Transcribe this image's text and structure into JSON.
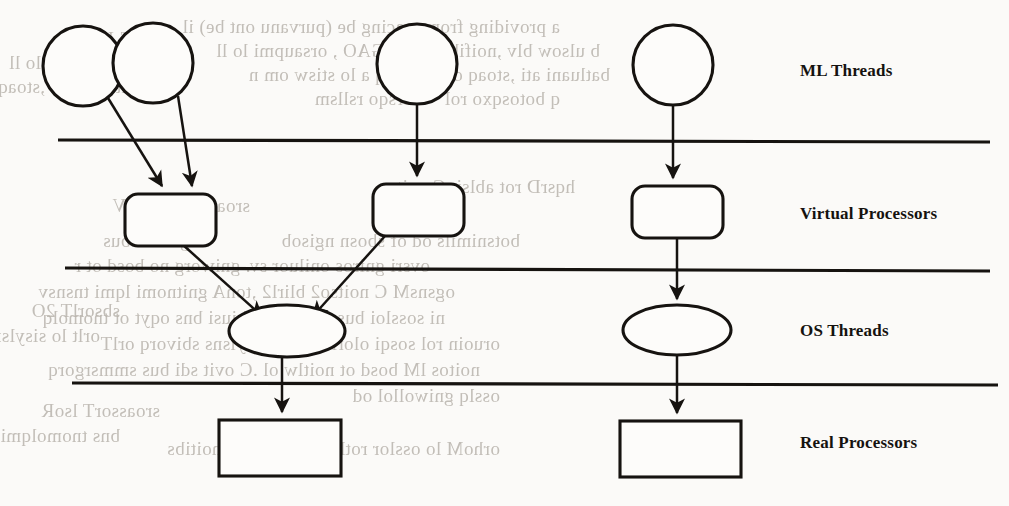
{
  "figure": {
    "layers": [
      {
        "id": "ml-threads",
        "label": "ML Threads",
        "label_x": 800,
        "label_y": 61,
        "shape": "circle"
      },
      {
        "id": "virtual-processors",
        "label": "Virtual Processors",
        "label_x": 800,
        "label_y": 204,
        "shape": "rounded-rect"
      },
      {
        "id": "os-threads",
        "label": "OS Threads",
        "label_x": 800,
        "label_y": 321,
        "shape": "ellipse"
      },
      {
        "id": "real-processors",
        "label": "Real Processors",
        "label_x": 800,
        "label_y": 433,
        "shape": "rect"
      }
    ],
    "dividers": [
      {
        "id": "divider-ml-vp",
        "x1": 58,
        "y1": 140,
        "x2": 990,
        "y2": 142
      },
      {
        "id": "divider-vp-os",
        "x1": 65,
        "y1": 268,
        "x2": 990,
        "y2": 271
      },
      {
        "id": "divider-os-rp",
        "x1": 72,
        "y1": 383,
        "x2": 998,
        "y2": 385
      }
    ],
    "nodes": {
      "ml_threads": [
        {
          "id": "ml-thread-1",
          "cx": 83,
          "cy": 66,
          "r": 40
        },
        {
          "id": "ml-thread-2",
          "cx": 153,
          "cy": 63,
          "r": 40
        },
        {
          "id": "ml-thread-3",
          "cx": 417,
          "cy": 64,
          "r": 40
        },
        {
          "id": "ml-thread-4",
          "cx": 673,
          "cy": 65,
          "r": 40
        }
      ],
      "virtual_processors": [
        {
          "id": "virtual-processor-1",
          "x": 125,
          "y": 194,
          "w": 91,
          "h": 52,
          "r": 13
        },
        {
          "id": "virtual-processor-2",
          "x": 373,
          "y": 184,
          "w": 91,
          "h": 52,
          "r": 13
        },
        {
          "id": "virtual-processor-3",
          "x": 632,
          "y": 186,
          "w": 91,
          "h": 52,
          "r": 13
        }
      ],
      "os_threads": [
        {
          "id": "os-thread-1",
          "cx": 287,
          "cy": 331,
          "rx": 58,
          "ry": 26
        },
        {
          "id": "os-thread-2",
          "cx": 677,
          "cy": 330,
          "rx": 54,
          "ry": 25
        }
      ],
      "real_processors": [
        {
          "id": "real-processor-1",
          "x": 219,
          "y": 420,
          "w": 122,
          "h": 56
        },
        {
          "id": "real-processor-2",
          "x": 620,
          "y": 421,
          "w": 121,
          "h": 56
        }
      ]
    },
    "edges": [
      {
        "id": "edge-ml1-vp1",
        "from": "ml-thread-1",
        "to": "virtual-processor-1",
        "x1": 108,
        "y1": 98,
        "x2": 162,
        "y2": 186
      },
      {
        "id": "edge-ml2-vp1",
        "from": "ml-thread-2",
        "to": "virtual-processor-1",
        "x1": 178,
        "y1": 96,
        "x2": 192,
        "y2": 186
      },
      {
        "id": "edge-ml3-vp2",
        "from": "ml-thread-3",
        "to": "virtual-processor-2",
        "x1": 417,
        "y1": 104,
        "x2": 417,
        "y2": 176
      },
      {
        "id": "edge-ml4-vp3",
        "from": "ml-thread-4",
        "to": "virtual-processor-3",
        "x1": 673,
        "y1": 105,
        "x2": 673,
        "y2": 178
      },
      {
        "id": "edge-vp1-os1",
        "from": "virtual-processor-1",
        "to": "os-thread-1",
        "x1": 182,
        "y1": 244,
        "x2": 262,
        "y2": 316
      },
      {
        "id": "edge-vp2-os1",
        "from": "virtual-processor-2",
        "to": "os-thread-1",
        "x1": 385,
        "y1": 236,
        "x2": 313,
        "y2": 316
      },
      {
        "id": "edge-vp3-os2",
        "from": "virtual-processor-3",
        "to": "os-thread-2",
        "x1": 677,
        "y1": 238,
        "x2": 677,
        "y2": 299
      },
      {
        "id": "edge-os1-rp1",
        "from": "os-thread-1",
        "to": "real-processor-1",
        "x1": 282,
        "y1": 357,
        "x2": 282,
        "y2": 412
      },
      {
        "id": "edge-os2-rp2",
        "from": "os-thread-2",
        "to": "real-processor-2",
        "x1": 677,
        "y1": 355,
        "x2": 677,
        "y2": 413
      }
    ]
  },
  "background_text": {
    "description": "faint mirrored bleed-through text from the reverse side of the scanned page",
    "lines": [
      {
        "id": "ghost-1",
        "text": "a providing from cracing be (purvanu ont be) il",
        "x": 560,
        "y": 16,
        "size": 19
      },
      {
        "id": "ghost-2",
        "text": "b ulsow blv ,noifibno ban ,GAO , orsaupmi lo ll",
        "x": 600,
        "y": 40,
        "size": 19
      },
      {
        "id": "ghost-3",
        "text": "batluani ati ,stoaq od lo toorq a lo stisw om n",
        "x": 610,
        "y": 64,
        "size": 19
      },
      {
        "id": "ghost-4",
        "text": "q botosqxo rol \" otsrsqo rsllsm",
        "x": 560,
        "y": 88,
        "size": 19
      },
      {
        "id": "ghost-5",
        "text": "hqsrD rot ablsi .C noitso",
        "x": 575,
        "y": 176,
        "size": 19
      },
      {
        "id": "ghost-6",
        "text": "botsnimils od of sbosn ngisob",
        "x": 520,
        "y": 230,
        "size": 19
      },
      {
        "id": "ghost-7",
        "text": "ovsri gniros oniluor sv. gniworg no bosd ot r",
        "x": 430,
        "y": 255,
        "size": 19
      },
      {
        "id": "ghost-8",
        "text": "ogsnsM C noitso2 blirl2 ,tonA gnitnomi lqmi tnsnsv",
        "x": 455,
        "y": 281,
        "size": 19
      },
      {
        "id": "ghost-9",
        "text": "ni sossloi bus xovi osrq .biusi bns oqyt ot tnomolq",
        "x": 445,
        "y": 307,
        "size": 19
      },
      {
        "id": "ghost-10",
        "text": "oruoin rol sosqi olorlw sil lo sisylsns sbivorq orlT",
        "x": 500,
        "y": 333,
        "size": 19
      },
      {
        "id": "ghost-11",
        "text": "noitos lM bosd ot noitlw ol .C ovit sdi bus smmsrgorq",
        "x": 480,
        "y": 359,
        "size": 19
      },
      {
        "id": "ghost-12",
        "text": "osslq gniwollol od",
        "x": 500,
        "y": 385,
        "size": 19
      },
      {
        "id": "ghost-13",
        "text": "orhoM lo osslor rotls sorl tomA lo noitibs",
        "x": 500,
        "y": 438,
        "size": 19
      },
      {
        "id": "ghost-14",
        "text": "sbsorlT JM",
        "x": 180,
        "y": 28,
        "size": 19
      },
      {
        "id": "ghost-15",
        "text": "orsaupmi lo ll",
        "x": 120,
        "y": 52,
        "size": 19
      },
      {
        "id": "ghost-16",
        "text": "batluani ati ,stoaq",
        "x": 140,
        "y": 76,
        "size": 19
      },
      {
        "id": "ghost-17",
        "text": "sroassorT lsutriV",
        "x": 250,
        "y": 195,
        "size": 19
      },
      {
        "id": "ghost-18",
        "text": "nguorrit bus",
        "x": 200,
        "y": 230,
        "size": 19
      },
      {
        "id": "ghost-19",
        "text": "sbsorlT 2O",
        "x": 120,
        "y": 300,
        "size": 19
      },
      {
        "id": "ghost-20",
        "text": "orlt lo sisylsns",
        "x": 100,
        "y": 325,
        "size": 19
      },
      {
        "id": "ghost-21",
        "text": "sroassorT lsoR",
        "x": 160,
        "y": 400,
        "size": 19
      },
      {
        "id": "ghost-22",
        "text": "bns tnomolqmi",
        "x": 120,
        "y": 425,
        "size": 19
      }
    ]
  },
  "colors": {
    "ink": "#161310",
    "paper": "#fbfaf8",
    "ghost": "#b9b4ad"
  }
}
